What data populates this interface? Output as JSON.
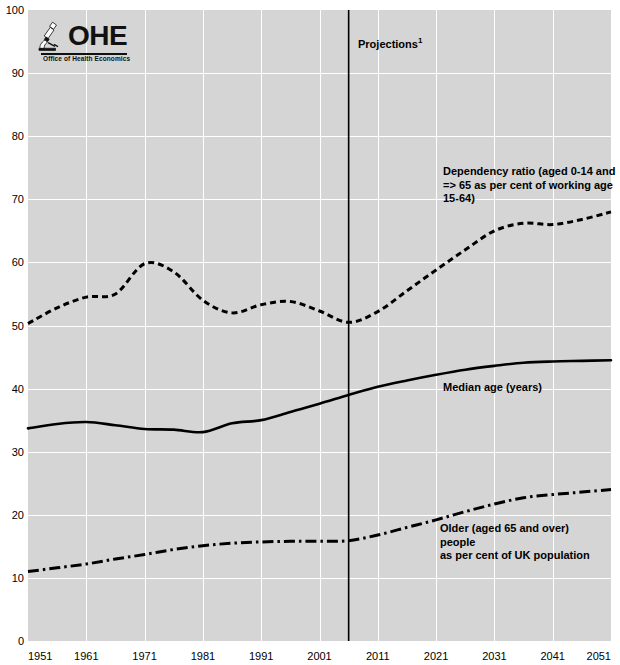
{
  "logo": {
    "name": "OHE",
    "subtitle": "Office of Health Economics",
    "icon": "microscope-icon"
  },
  "annotations": {
    "projections": "Projections",
    "projections_superscript": "1",
    "dependency": "Dependency ratio (aged 0-14 and => 65 as per cent of working age 15-64)",
    "median": "Median age (years)",
    "older_line1": "Older (aged 65 and over)",
    "older_line2": "people",
    "older_line3": "as per cent of UK population"
  },
  "colors": {
    "plot_background": "#d5d5d5",
    "gridline": "#ffffff",
    "series": "#000000",
    "page_background": "#ffffff"
  },
  "chart_data": {
    "type": "line",
    "title": "",
    "xlabel": "",
    "ylabel": "",
    "xlim": [
      1951,
      2051
    ],
    "ylim": [
      0,
      100
    ],
    "grid": true,
    "legend": "annotations-on-plot",
    "xticks": [
      1951,
      1961,
      1971,
      1981,
      1991,
      2001,
      2011,
      2021,
      2031,
      2041,
      2051
    ],
    "yticks": [
      0,
      10,
      20,
      30,
      40,
      50,
      60,
      70,
      80,
      90,
      100
    ],
    "projection_start_year": 2006,
    "x": [
      1951,
      1956,
      1961,
      1966,
      1971,
      1976,
      1981,
      1986,
      1991,
      1996,
      2001,
      2006,
      2011,
      2016,
      2021,
      2026,
      2031,
      2036,
      2041,
      2046,
      2051
    ],
    "series": [
      {
        "name": "Dependency ratio (aged 0-14 and => 65 as per cent of working age 15-64)",
        "style": "dashed",
        "values": [
          50.3,
          52.8,
          54.5,
          55.0,
          59.8,
          58.5,
          54.0,
          52.0,
          53.3,
          53.8,
          52.3,
          50.5,
          52.2,
          55.5,
          58.8,
          62.0,
          65.0,
          66.2,
          66.0,
          66.8,
          68.0
        ]
      },
      {
        "name": "Median age (years)",
        "style": "solid",
        "values": [
          33.7,
          34.4,
          34.7,
          34.2,
          33.6,
          33.5,
          33.1,
          34.5,
          35.0,
          36.3,
          37.6,
          39.0,
          40.3,
          41.3,
          42.2,
          43.0,
          43.6,
          44.1,
          44.3,
          44.4,
          44.5
        ]
      },
      {
        "name": "Older (aged 65 and over) people as per cent of UK population",
        "style": "dash-dot",
        "values": [
          11.0,
          11.6,
          12.2,
          13.0,
          13.7,
          14.5,
          15.1,
          15.5,
          15.7,
          15.8,
          15.8,
          15.9,
          16.8,
          18.0,
          19.2,
          20.5,
          21.7,
          22.7,
          23.2,
          23.6,
          24.0
        ]
      }
    ]
  }
}
